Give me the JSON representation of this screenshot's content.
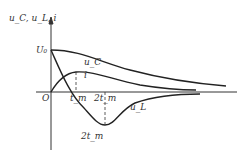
{
  "labels": {
    "yaxis": "u_C, u_L, i",
    "u0": "U₀",
    "uc": "u_C",
    "i": "i",
    "ul": "u_L",
    "origin": "O",
    "tm": "t_m",
    "two_tm": "2t_m",
    "two_tm_below": "2t_m"
  }
}
